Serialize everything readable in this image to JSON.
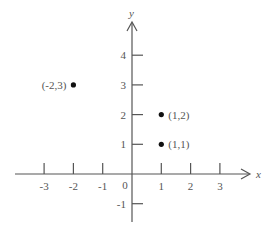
{
  "chart_data": {
    "type": "scatter",
    "title": "",
    "xlabel": "x",
    "ylabel": "y",
    "xlim": [
      -3.9,
      4.1
    ],
    "ylim": [
      -1.7,
      5.2
    ],
    "grid": false,
    "legend": null,
    "x_ticks": [
      -3,
      -2,
      -1,
      1,
      2,
      3
    ],
    "x_tick_labels": [
      "-3",
      "-2",
      "-1",
      "1",
      "2",
      "3"
    ],
    "y_ticks": [
      -1,
      1,
      2,
      3,
      4
    ],
    "y_tick_labels": [
      "-1",
      "1",
      "2",
      "3",
      "4"
    ],
    "origin_label": "0",
    "points": [
      {
        "x": -2,
        "y": 3,
        "label": "(-2,3)",
        "label_side": "left"
      },
      {
        "x": 1,
        "y": 2,
        "label": "(1,2)",
        "label_side": "right"
      },
      {
        "x": 1,
        "y": 1,
        "label": "(1,1)",
        "label_side": "right"
      }
    ],
    "colors": {
      "axis": "#555555",
      "point": "#111111",
      "text": "#555555"
    }
  }
}
